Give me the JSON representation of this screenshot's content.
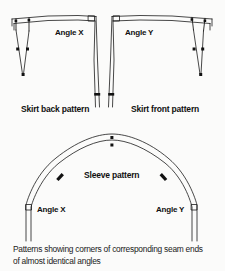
{
  "figure": {
    "background_color": "#fbfbfa",
    "line_color": "#1a1a1a"
  },
  "labels": {
    "angle_x_top": "Angle X",
    "angle_y_top": "Angle Y",
    "skirt_back": "Skirt back pattern",
    "skirt_front": "Skirt front pattern",
    "sleeve": "Sleeve pattern",
    "angle_x_bottom": "Angle X",
    "angle_y_bottom": "Angle Y"
  },
  "caption": {
    "line1": "Patterns showing corners of corresponding seam ends",
    "line2": "of almost identical angles"
  },
  "pattern_pieces": [
    {
      "name": "skirt-back-pattern",
      "label": "Skirt back pattern",
      "angle_label": "Angle X",
      "marks": [
        "waist-notch-pair",
        "dart",
        "side-seam-notch",
        "square-corner"
      ]
    },
    {
      "name": "skirt-front-pattern",
      "label": "Skirt front pattern",
      "angle_label": "Angle Y",
      "marks": [
        "waist-notch-pair",
        "dart",
        "side-seam-notch",
        "square-corner"
      ]
    },
    {
      "name": "sleeve-pattern",
      "label": "Sleeve pattern",
      "angle_labels": [
        "Angle X",
        "Angle Y"
      ],
      "marks": [
        "cap-double-notch",
        "front-notch",
        "back-notch",
        "square-corner-left",
        "square-corner-right"
      ]
    }
  ]
}
